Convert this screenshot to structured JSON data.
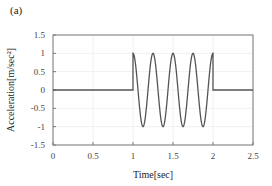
{
  "panel_label": "(a)",
  "chart_data": {
    "type": "line",
    "title": "",
    "xlabel": "Time[sec]",
    "ylabel": "Acceleration[m/sec²]",
    "xlim": [
      0,
      2.5
    ],
    "ylim": [
      -1.5,
      1.5
    ],
    "xticks": [
      "0",
      "0.5",
      "1",
      "1.5",
      "2",
      "2.5"
    ],
    "yticks": [
      "1.5",
      "1",
      "0.5",
      "0",
      "-0.5",
      "-1",
      "-1.5"
    ],
    "grid": true,
    "legend": null,
    "series": [
      {
        "name": "acceleration",
        "color": "#555555",
        "description": "0 for t<1 s; cosine wave amplitude 1, frequency 4 Hz for 1≤t≤2 s; 0 for t>2 s",
        "x": [
          0,
          1.0,
          1.0,
          1.125,
          1.25,
          1.375,
          1.5,
          1.625,
          1.75,
          1.875,
          2.0,
          2.0,
          2.5
        ],
        "y": [
          0,
          0,
          1,
          -1,
          1,
          -1,
          1,
          -1,
          1,
          -1,
          1,
          0,
          0
        ]
      }
    ]
  }
}
